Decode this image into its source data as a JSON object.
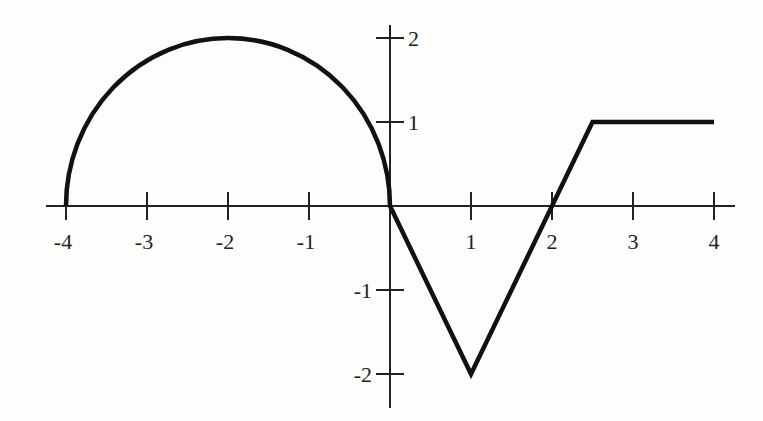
{
  "chart_data": {
    "type": "line",
    "title": "",
    "xlabel": "",
    "ylabel": "",
    "xlim": [
      -4,
      4
    ],
    "ylim": [
      -2,
      2
    ],
    "grid": false,
    "legend": null,
    "x_ticks": [
      "-4",
      "-3",
      "-2",
      "-1",
      "1",
      "2",
      "3",
      "4"
    ],
    "y_ticks": [
      "2",
      "1",
      "-1",
      "-2"
    ],
    "series": [
      {
        "name": "f(x)",
        "pieces": [
          {
            "kind": "semicircle",
            "description": "upper semicircle centered at (-2, 0) with radius 2",
            "x_range": [
              -4,
              0
            ],
            "points": [
              [
                -4,
                0
              ],
              [
                -2,
                2
              ],
              [
                0,
                0
              ]
            ]
          },
          {
            "kind": "line",
            "points": [
              [
                0,
                0
              ],
              [
                1,
                -2
              ]
            ]
          },
          {
            "kind": "line",
            "points": [
              [
                1,
                -2
              ],
              [
                2,
                0
              ],
              [
                2.5,
                1
              ]
            ]
          },
          {
            "kind": "line",
            "points": [
              [
                2.5,
                1
              ],
              [
                4,
                1
              ]
            ]
          }
        ],
        "x": [
          -4,
          -3,
          -2,
          -1,
          0,
          1,
          2,
          2.5,
          3,
          4
        ],
        "y": [
          0,
          1.732,
          2,
          1.732,
          0,
          -2,
          0,
          1,
          1,
          1
        ]
      }
    ]
  }
}
